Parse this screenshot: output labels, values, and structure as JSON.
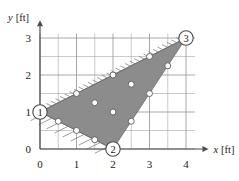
{
  "figure": {
    "title": "",
    "axes": {
      "x": {
        "label": "x [ft]",
        "unit": "ft",
        "ticks": [
          "0",
          "1",
          "2",
          "3",
          "4"
        ],
        "min": 0,
        "max": 4.45
      },
      "y": {
        "label": "y [ft]",
        "unit": "ft",
        "ticks": [
          "0",
          "1",
          "2",
          "3"
        ],
        "min": 0,
        "max": 3.3
      }
    },
    "nodes": [
      {
        "id": "1",
        "label": "1",
        "x": 0,
        "y": 1
      },
      {
        "id": "2",
        "label": "2",
        "x": 2,
        "y": 0
      },
      {
        "id": "3",
        "label": "3",
        "x": 4,
        "y": 3
      }
    ],
    "colors": {
      "fill": "#8c8c8c",
      "grid": "#9a9a9a",
      "axis": "#4a4a4a",
      "edge": "#6e6e6e",
      "dot": "#ffffff",
      "dot_stroke": "#5a5a5a",
      "hatch": "#8a8a8a"
    }
  },
  "chart_data": {
    "type": "scatter",
    "title": "",
    "xlabel": "x [ft]",
    "ylabel": "y [ft]",
    "xlim": [
      0,
      4.45
    ],
    "ylim": [
      0,
      3.3
    ],
    "xticks": [
      0,
      1,
      2,
      3,
      4
    ],
    "yticks": [
      0,
      1,
      2,
      3
    ],
    "minor_grid_step": 0.5,
    "grid": true,
    "legend": "none",
    "shaded_polygon": {
      "name": "triangular-element",
      "vertices": [
        [
          0,
          1
        ],
        [
          2,
          0
        ],
        [
          4,
          3
        ]
      ],
      "fill": "#8c8c8c"
    },
    "hatched_edges": [
      {
        "from": [
          0,
          1
        ],
        "to": [
          4,
          3
        ],
        "side": "upper-left"
      },
      {
        "from": [
          0,
          1
        ],
        "to": [
          2,
          0
        ],
        "side": "lower-left"
      }
    ],
    "corner_nodes": [
      {
        "label": "1",
        "x": 0,
        "y": 1
      },
      {
        "label": "2",
        "x": 2,
        "y": 0
      },
      {
        "label": "3",
        "x": 4,
        "y": 3
      }
    ],
    "series": [
      {
        "name": "edge-1-3-points",
        "points": [
          [
            1,
            1.5
          ],
          [
            2,
            2
          ],
          [
            3,
            2.5
          ]
        ]
      },
      {
        "name": "edge-1-2-points",
        "points": [
          [
            0.5,
            0.75
          ],
          [
            1,
            0.5
          ],
          [
            1.5,
            0.25
          ]
        ]
      },
      {
        "name": "edge-2-3-points",
        "points": [
          [
            2.5,
            0.75
          ],
          [
            3,
            1.5
          ],
          [
            3.5,
            2.25
          ]
        ]
      },
      {
        "name": "interior-points",
        "points": [
          [
            1.5,
            1.25
          ],
          [
            2,
            1
          ],
          [
            2.5,
            1.75
          ]
        ]
      }
    ]
  }
}
